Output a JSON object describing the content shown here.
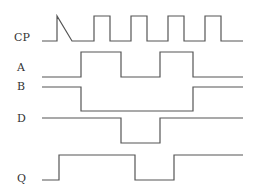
{
  "diagram": {
    "type": "timing-diagram",
    "colors": {
      "line": "#555555",
      "text": "#333333",
      "background": "#ffffff"
    },
    "signals": [
      {
        "name": "CP",
        "label_x": 14,
        "label_y": 32,
        "points": "42,41 57,41 57,16 72,41 72,41 94,41 94,16 110,16 110,41 131,41 131,16 147,16 147,41 168,41 168,16 184,16 184,41 205,41 205,16 221,16 221,41 243,41",
        "wave": "0101010101 0"
      },
      {
        "name": "A",
        "label_x": 17,
        "label_y": 62,
        "points": "42,77 81,77 81,52 121,52 121,77 160,77 160,52 193,52 193,77 243,77",
        "wave": "0 1 0 1 0"
      },
      {
        "name": "B",
        "label_x": 17,
        "label_y": 81,
        "points": "42,87 81,87 81,111 193,111 193,87 243,87",
        "wave": "1 0 1"
      },
      {
        "name": "D",
        "label_x": 17,
        "label_y": 113,
        "points": "42,118 121,118 121,143 160,143 160,118 243,118",
        "wave": "1 0 1"
      },
      {
        "name": "Q",
        "label_x": 17,
        "label_y": 173,
        "points": "42,180 59,180 59,155 135,155 135,180 174,180 174,155 243,155",
        "wave": "0 1 0 1"
      }
    ]
  }
}
